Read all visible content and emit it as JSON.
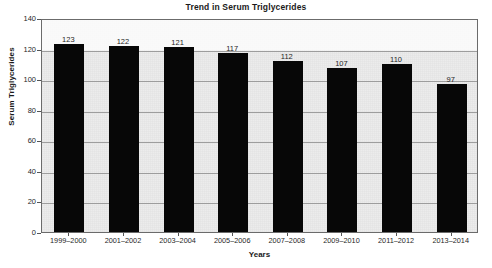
{
  "chart_data": {
    "type": "bar",
    "title": "Trend in Serum Triglycerides",
    "xlabel": "Years",
    "ylabel": "Serum Triglycerides",
    "categories": [
      "1999–2000",
      "2001–2002",
      "2003–2004",
      "2005–2006",
      "2007–2008",
      "2009–2010",
      "2011–2012",
      "2013–2014"
    ],
    "values": [
      123,
      122,
      121,
      117,
      112,
      107,
      110,
      97
    ],
    "data_labels": [
      "123",
      "122",
      "121",
      "117",
      "112",
      "107",
      "110",
      "97"
    ],
    "ylim": [
      0,
      140
    ],
    "ytick_values": [
      0,
      20,
      40,
      60,
      80,
      100,
      120,
      140
    ],
    "ytick_labels": [
      "0",
      "20",
      "40",
      "60",
      "80",
      "100",
      "120",
      "140"
    ],
    "grid": true,
    "legend": false,
    "legend_position": "none",
    "bar_color": "#070707",
    "plot_background": "#e9e9e9",
    "gridline_color": "#9d9d9d",
    "axis_color": "#6b6b6b",
    "text_color": "#1a1a1a"
  }
}
